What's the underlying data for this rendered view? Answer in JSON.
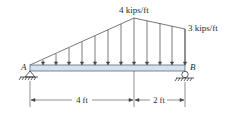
{
  "diagram": {
    "type": "beam-distributed-load",
    "loads": {
      "peak_label": "4 kips/ft",
      "end_label": "3 kips/ft"
    },
    "supports": {
      "left_label": "A",
      "right_label": "B",
      "left_type": "pin",
      "right_type": "roller"
    },
    "dimensions": {
      "left_span": "4 ft",
      "right_span": "2 ft"
    },
    "colors": {
      "beam_fill": "#d6e2ec",
      "beam_stroke": "#5a6a78",
      "line": "#333333"
    }
  }
}
